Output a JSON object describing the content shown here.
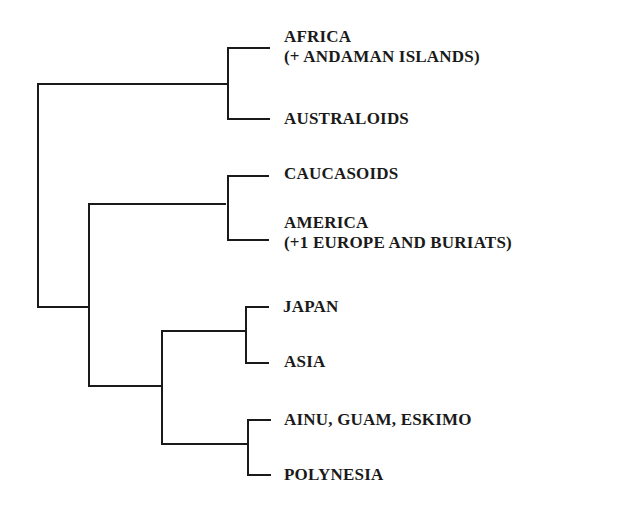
{
  "diagram": {
    "type": "dendrogram",
    "line_color": "#1a1a1a",
    "background": "#ffffff",
    "leaves": [
      {
        "id": "africa",
        "line1": "AFRICA",
        "line2": "(+ ANDAMAN ISLANDS)"
      },
      {
        "id": "australoids",
        "line1": "AUSTRALOIDS"
      },
      {
        "id": "caucasoids",
        "line1": "CAUCASOIDS"
      },
      {
        "id": "america",
        "line1": "AMERICA",
        "line2": "(+1 EUROPE AND BURIATS)"
      },
      {
        "id": "japan",
        "line1": "JAPAN"
      },
      {
        "id": "asia",
        "line1": "ASIA"
      },
      {
        "id": "ainu-guam-eskimo",
        "line1": "AINU, GUAM, ESKIMO"
      },
      {
        "id": "polynesia",
        "line1": "POLYNESIA"
      }
    ],
    "structure": "((AFRICA, AUSTRALOIDS), ((CAUCASOIDS, AMERICA), ((JAPAN, ASIA), (AINU-GUAM-ESKIMO, POLYNESIA))))"
  }
}
